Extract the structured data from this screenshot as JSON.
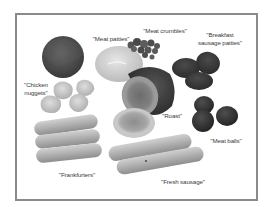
{
  "figure": {
    "frame_color": "#8a8a8a",
    "colormode": "grayscale",
    "labels": {
      "meat_patties": "\"Meat patties\"",
      "meat_crumbles": "\"Meat crumbles\"",
      "breakfast_line1": "\"Breakfast",
      "breakfast_line2": "sausage patties\"",
      "chicken_line1": "\"Chicken",
      "chicken_line2": "nuggets\"",
      "roast": "\"Roast\"",
      "meat_balls": "\"Meat balls\"",
      "frankfurters": "\"Frankfurters\"",
      "fresh_sausage": "\"Fresh sausage\""
    },
    "items": [
      {
        "name": "Meat patties",
        "count": 2
      },
      {
        "name": "Meat crumbles",
        "count": 1
      },
      {
        "name": "Breakfast sausage patties",
        "count": 3
      },
      {
        "name": "Chicken nuggets",
        "count": 4
      },
      {
        "name": "Roast",
        "count": 2
      },
      {
        "name": "Meat balls",
        "count": 3
      },
      {
        "name": "Frankfurters",
        "count": 3
      },
      {
        "name": "Fresh sausage",
        "count": 2
      }
    ]
  }
}
